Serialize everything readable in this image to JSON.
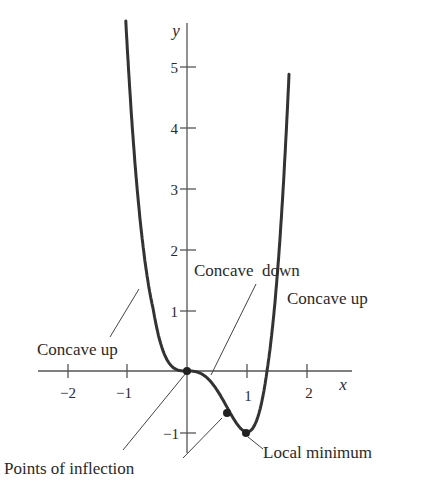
{
  "figure": {
    "axis_labels": {
      "x": "x",
      "y": "y"
    },
    "x_ticks": [
      {
        "value": -2,
        "label": "−2"
      },
      {
        "value": -1,
        "label": "−1"
      },
      {
        "value": 1,
        "label": "1"
      },
      {
        "value": 2,
        "label": "2"
      }
    ],
    "y_ticks": [
      {
        "value": 5,
        "label": "5"
      },
      {
        "value": 4,
        "label": "4"
      },
      {
        "value": 3,
        "label": "3"
      },
      {
        "value": 2,
        "label": "2"
      },
      {
        "value": 1,
        "label": "1"
      },
      {
        "value": -1,
        "label": "−1"
      }
    ],
    "annotations": {
      "concave_up_left": "Concave up",
      "concave_down": "Concave  down",
      "concave_up_right": "Concave up",
      "points_of_inflection": "Points of inflection",
      "local_minimum": "Local minimum"
    },
    "curve": {
      "function": "y = 3x^4 - 4x^3",
      "x_range": [
        -1.02,
        1.7
      ],
      "color": "#333333"
    },
    "points": [
      {
        "name": "inflection-1",
        "x": 0,
        "y": 0
      },
      {
        "name": "inflection-2",
        "x": 0.667,
        "y": -0.59
      },
      {
        "name": "local-minimum",
        "x": 1,
        "y": -1
      }
    ]
  }
}
